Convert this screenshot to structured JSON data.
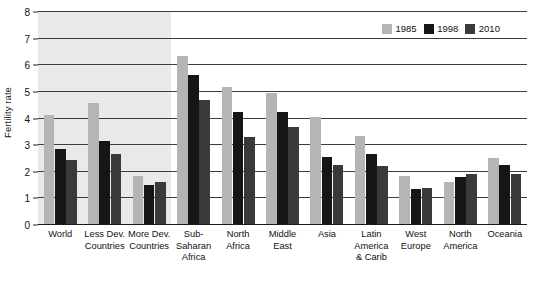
{
  "chart_data": {
    "type": "bar",
    "title": "",
    "xlabel": "",
    "ylabel": "Fertility rate",
    "ylim": [
      0,
      8
    ],
    "yticks": [
      "0",
      "1",
      "2",
      "3",
      "4",
      "5",
      "6",
      "7",
      "8"
    ],
    "grid": true,
    "legend_position": "top-right",
    "categories": [
      "World",
      "Less Dev. Countries",
      "More Dev. Countries",
      "Sub-Saharan Africa",
      "North Africa",
      "Middle East",
      "Asia",
      "Latin America & Carib",
      "West Europe",
      "North America",
      "Oceania"
    ],
    "category_label_lines": [
      [
        "World"
      ],
      [
        "Less Dev.",
        "Countries"
      ],
      [
        "More Dev.",
        "Countries"
      ],
      [
        "Sub-",
        "Saharan",
        "Africa"
      ],
      [
        "North",
        "Africa"
      ],
      [
        "Middle",
        "East"
      ],
      [
        "Asia"
      ],
      [
        "Latin",
        "America",
        "& Carib"
      ],
      [
        "West",
        "Europe"
      ],
      [
        "North",
        "America"
      ],
      [
        "Oceania"
      ]
    ],
    "series": [
      {
        "name": "1985",
        "color": "#b5b5b5",
        "values": [
          4.15,
          4.6,
          1.85,
          6.35,
          5.2,
          4.95,
          4.05,
          3.35,
          1.85,
          1.6,
          2.5
        ]
      },
      {
        "name": "1998",
        "color": "#161616",
        "values": [
          2.85,
          3.15,
          1.5,
          5.65,
          4.25,
          4.25,
          2.55,
          2.65,
          1.35,
          1.8,
          2.25
        ]
      },
      {
        "name": "2010",
        "color": "#3a3a3a",
        "values": [
          2.45,
          2.65,
          1.6,
          4.7,
          3.3,
          3.7,
          2.25,
          2.2,
          1.4,
          1.9,
          1.9
        ]
      }
    ],
    "shaded_region": {
      "from_category_index": 0,
      "to_category_index": 2
    }
  },
  "legend": {
    "items": [
      {
        "label": "1985",
        "color": "#b5b5b5",
        "swatch_name": "legend-swatch-1985"
      },
      {
        "label": "1998",
        "color": "#161616",
        "swatch_name": "legend-swatch-1998"
      },
      {
        "label": "2010",
        "color": "#3a3a3a",
        "swatch_name": "legend-swatch-2010"
      }
    ]
  },
  "colors": {
    "background": "#ffffff",
    "shaded_panel": "#e9e9e9",
    "gridline": "#3d3d3d",
    "axis": "#1a1a1a",
    "text": "#111111"
  }
}
